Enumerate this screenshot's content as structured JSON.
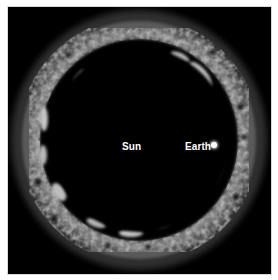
{
  "figure": {
    "labels": {
      "sun": "Sun",
      "earth": "Earth"
    },
    "colors": {
      "background": "#000000",
      "frame": "#ffffff",
      "ring_bright": "#f2f2f2",
      "ring_mid": "#8a8a8a",
      "ring_dim": "#3a3a3a",
      "label": "#ffffff"
    }
  }
}
